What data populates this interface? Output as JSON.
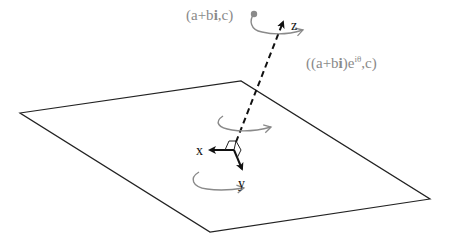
{
  "colors": {
    "ink": "#111111",
    "gray": "#8a8a8a",
    "background": "#ffffff"
  },
  "axes": {
    "x_label": "x",
    "y_label": "y",
    "z_label": "z"
  },
  "points": {
    "initial": {
      "prefix": "(a+b",
      "bold": "i",
      "suffix": ",c)"
    },
    "rotated": {
      "prefix": "((a+b",
      "bold": "i",
      "mid": ")e",
      "superscript": "iθ",
      "suffix": ",c)"
    }
  },
  "plane": {
    "corners": [
      [
        20,
        113
      ],
      [
        241,
        81
      ],
      [
        430,
        199
      ],
      [
        210,
        232
      ]
    ]
  }
}
